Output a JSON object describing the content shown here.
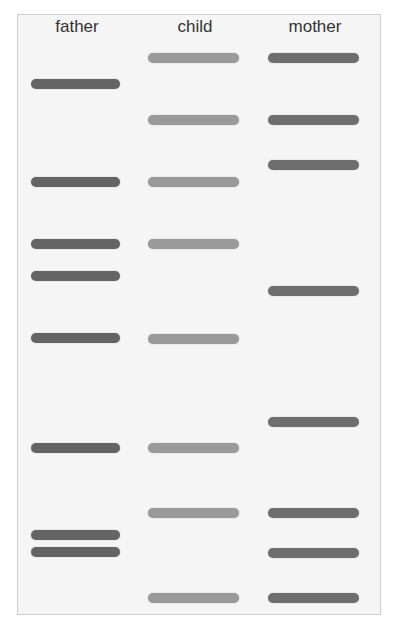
{
  "figure": {
    "frame": {
      "left": 17,
      "top": 14,
      "width": 364,
      "height": 601,
      "background": "#f5f5f5",
      "border": "#cfcfcf"
    },
    "lanes": [
      {
        "label": "father",
        "center_x": 77,
        "band_left": 31,
        "band_width": 89,
        "color": "#646464",
        "bands_y": [
          84,
          182,
          244,
          276,
          338,
          448,
          535,
          552
        ]
      },
      {
        "label": "child",
        "center_x": 195,
        "band_left": 148,
        "band_width": 91,
        "color": "#9a9a9a",
        "bands_y": [
          58,
          120,
          182,
          244,
          339,
          448,
          513,
          598
        ]
      },
      {
        "label": "mother",
        "center_x": 315,
        "band_left": 268,
        "band_width": 91,
        "color": "#6e6e6e",
        "bands_y": [
          58,
          120,
          165,
          291,
          422,
          513,
          553,
          598
        ]
      }
    ]
  }
}
